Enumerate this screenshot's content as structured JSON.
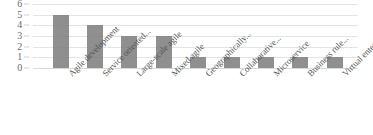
{
  "chart_data": {
    "type": "bar",
    "title": "",
    "xlabel": "",
    "ylabel": "",
    "ylim": [
      0,
      6
    ],
    "grid": true,
    "legend": "none",
    "bar_color": "#7f7f7f",
    "gridline_color": "#e4e4e4",
    "axis_text_color": "#555555",
    "y_ticks": [
      6,
      5,
      4,
      3,
      2,
      1,
      0
    ],
    "categories": [
      "Agile development",
      "Service oriented...",
      "Large-scale agile",
      "Mixed agile",
      "Geographically...",
      "Collaborative...",
      "Microservice",
      "Business rule...",
      "Virtual enterprise"
    ],
    "values": [
      5,
      4,
      3,
      3,
      1,
      1,
      1,
      1,
      1
    ]
  }
}
